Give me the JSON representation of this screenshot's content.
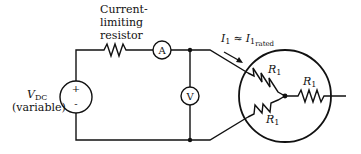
{
  "diagram": {
    "resistor_label": [
      "Current-",
      "limiting",
      "resistor"
    ],
    "ammeter_symbol": "A",
    "voltmeter_symbol": "V",
    "source_label": "V",
    "source_label_sub": "DC",
    "source_variable": "(variable)",
    "source_plus": "+",
    "source_minus": "-",
    "current_label_I": "I",
    "current_label_sub": "1",
    "current_approx": "≈",
    "current_rated_I": "I",
    "current_rated_sub": "1",
    "current_rated_subsub": "rated",
    "r_label": "R",
    "r_sub": "1",
    "stroke_color": "#111111"
  }
}
